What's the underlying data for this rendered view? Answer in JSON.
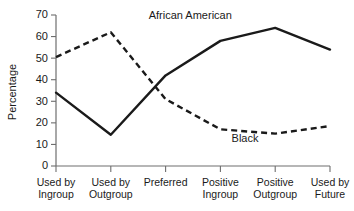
{
  "chart_data": {
    "type": "line",
    "title": "",
    "subtitle": "",
    "xlabel": "",
    "ylabel": "Percentage",
    "ylim": [
      0,
      70
    ],
    "yticks": [
      0,
      10,
      20,
      30,
      40,
      50,
      60,
      70
    ],
    "ytick_labels": [
      "0",
      "10",
      "20",
      "30",
      "40",
      "50",
      "60",
      "70"
    ],
    "grid": false,
    "legend": "inline-annotations",
    "categories": [
      "Used by\nIngroup",
      "Used by\nOutgroup",
      "Preferred",
      "Positive\nIngroup",
      "Positive\nOutgroup",
      "Used by\nFuture"
    ],
    "category_lines": [
      [
        "Used by",
        "Ingroup"
      ],
      [
        "Used by",
        "Outgroup"
      ],
      [
        "Preferred",
        ""
      ],
      [
        "Positive",
        "Ingroup"
      ],
      [
        "Positive",
        "Outgroup"
      ],
      [
        "Used by",
        "Future"
      ]
    ],
    "series": [
      {
        "name": "African American",
        "style": "solid",
        "color": "#1a1a1a",
        "values": [
          34,
          14.5,
          42,
          58,
          64,
          54
        ]
      },
      {
        "name": "Black",
        "style": "dashed",
        "color": "#1a1a1a",
        "values": [
          50.5,
          62,
          31,
          17,
          15,
          18.5
        ]
      }
    ],
    "annotations": [
      {
        "text": "African American",
        "x_category_index": 2.45,
        "y_value": 68
      },
      {
        "text": "Black",
        "x_category_index": 3.45,
        "y_value": 11
      }
    ]
  }
}
